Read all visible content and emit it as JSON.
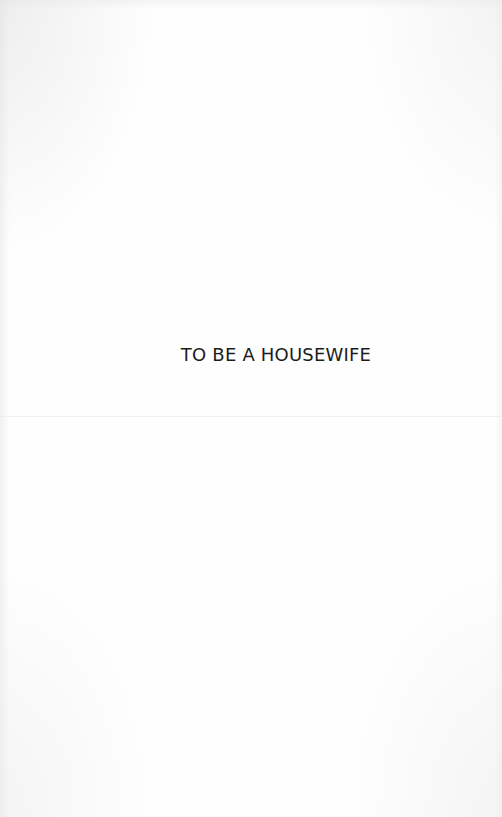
{
  "page": {
    "title": "TO BE A HOUSEWIFE",
    "background_color": "#fefefe",
    "text_color": "#1c1c1c"
  }
}
